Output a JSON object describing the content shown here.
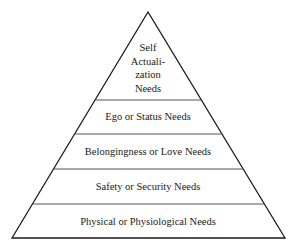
{
  "diagram": {
    "type": "pyramid",
    "levels": [
      {
        "id": "self-actualization",
        "label_lines": [
          "Self",
          "Actuali-",
          "zation",
          "Needs"
        ]
      },
      {
        "id": "ego-status",
        "label": "Ego or Status Needs"
      },
      {
        "id": "belongingness-love",
        "label": "Belongingness or Love Needs"
      },
      {
        "id": "safety-security",
        "label": "Safety or Security Needs"
      },
      {
        "id": "physical-physiological",
        "label": "Physical or Physiological Needs"
      }
    ],
    "colors": {
      "outline": "#1a1a1a",
      "divider": "#555555",
      "fill": "#ffffff",
      "text": "#1a1a1a"
    }
  }
}
